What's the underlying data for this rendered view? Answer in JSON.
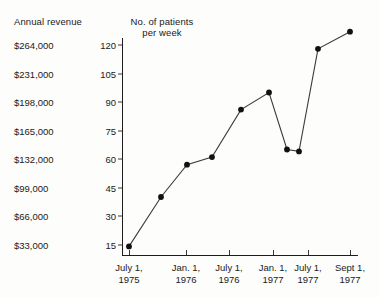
{
  "headers": {
    "revenue": "Annual revenue",
    "patients": "No. of patients\nper week"
  },
  "chart_data": {
    "type": "line",
    "title": "",
    "xlabel": "",
    "ylabel": "No. of patients per week",
    "y2label": "Annual revenue",
    "ylim": [
      0,
      128
    ],
    "grid": false,
    "legend": null,
    "revenue_ticks": [
      {
        "value": 264000,
        "label": "$264,000",
        "patients": 120
      },
      {
        "value": 231000,
        "label": "$231,000",
        "patients": 105
      },
      {
        "value": 198000,
        "label": "$198,000",
        "patients": 90
      },
      {
        "value": 165000,
        "label": "$165,000",
        "patients": 75
      },
      {
        "value": 132000,
        "label": "$132,000",
        "patients": 60
      },
      {
        "value": 99000,
        "label": "$99,000",
        "patients": 45
      },
      {
        "value": 66000,
        "label": "$66,000",
        "patients": 30
      },
      {
        "value": 33000,
        "label": "$33,000",
        "patients": 15
      }
    ],
    "patient_ticks": [
      {
        "value": 120,
        "label": "120"
      },
      {
        "value": 105,
        "label": "105"
      },
      {
        "value": 90,
        "label": "90"
      },
      {
        "value": 75,
        "label": "75"
      },
      {
        "value": 60,
        "label": "60"
      },
      {
        "value": 45,
        "label": "45"
      },
      {
        "value": 30,
        "label": "30"
      },
      {
        "value": 15,
        "label": "15"
      }
    ],
    "x_ticks": [
      {
        "label": "July 1,\n1975"
      },
      {
        "label": "Jan. 1,\n1976"
      },
      {
        "label": "July 1,\n1976"
      },
      {
        "label": "Jan. 1,\n1977"
      },
      {
        "label": "July 1,\n1977"
      },
      {
        "label": "Sept 1,\n1977"
      }
    ],
    "points": [
      {
        "x": "July 1, 1975",
        "y": 14
      },
      {
        "x": "Oct. 1975",
        "y": 40
      },
      {
        "x": "Jan. 1, 1976",
        "y": 57
      },
      {
        "x": "Apr. 1976",
        "y": 61
      },
      {
        "x": "July 1, 1976",
        "y": 86
      },
      {
        "x": "Oct. 1976",
        "y": 95
      },
      {
        "x": "Jan. 1, 1977",
        "y": 65
      },
      {
        "x": "Mar. 1977",
        "y": 64
      },
      {
        "x": "July 1, 1977",
        "y": 118
      },
      {
        "x": "Sept 1, 1977",
        "y": 127
      }
    ]
  },
  "colors": {
    "line": "#3b3b3b",
    "marker": "#111111",
    "axis": "#1d1d1d",
    "background": "#fdfdfb",
    "text": "#1a1a1a"
  }
}
